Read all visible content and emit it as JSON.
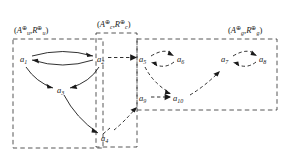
{
  "figure": {
    "name": "argumentation-framework-partition-diagram",
    "background_color": "#ffffff",
    "ink_color": "#1a1a1a"
  },
  "groups": [
    {
      "id": "u",
      "name": "group-u",
      "label_open": "(",
      "label_A": "A",
      "label_A_sub": "u",
      "label_A_sup": "⊕",
      "label_comma": ",",
      "label_R": "R",
      "label_R_sub": "u",
      "label_R_sup": "⊕",
      "label_close": ")",
      "label_text": "(Aᵤ⊕, Rᵤ⊕)",
      "box": {
        "x": 13,
        "y": 39,
        "w": 90,
        "h": 109
      },
      "label_pos": {
        "x": 14,
        "y": 33
      }
    },
    {
      "id": "c",
      "name": "group-c",
      "label_open": "(",
      "label_A": "A",
      "label_A_sub": "c",
      "label_A_sup": "⊕",
      "label_comma": ",",
      "label_R": "R",
      "label_R_sub": "c",
      "label_R_sup": "⊕",
      "label_close": ")",
      "label_text": "(Aₑ⊕, Rₑ⊕)",
      "box": {
        "x": 96,
        "y": 33,
        "w": 41,
        "h": 114
      },
      "label_pos": {
        "x": 97,
        "y": 27
      }
    },
    {
      "id": "g",
      "name": "group-g",
      "label_open": "(",
      "label_A": "A",
      "label_A_sub": "g",
      "label_A_sup": "⊕",
      "label_comma": ",",
      "label_R": "R",
      "label_R_sub": "g",
      "label_R_sup": "⊕",
      "label_close": ")",
      "label_text": "(Aᵧ⊕, Rᵧ⊕)",
      "box": {
        "x": 137,
        "y": 39,
        "w": 140,
        "h": 71
      },
      "label_pos": {
        "x": 228,
        "y": 33
      }
    }
  ],
  "nodes": [
    {
      "id": "a1",
      "base": "a",
      "sub": "1",
      "x": 24,
      "y": 60,
      "group": "u"
    },
    {
      "id": "a2",
      "base": "a",
      "sub": "2",
      "x": 101,
      "y": 60,
      "group": "u"
    },
    {
      "id": "a3",
      "base": "a",
      "sub": "3",
      "x": 61,
      "y": 91,
      "group": "u"
    },
    {
      "id": "a4",
      "base": "a",
      "sub": "4",
      "x": 105,
      "y": 139,
      "group": "c"
    },
    {
      "id": "a5",
      "base": "a",
      "sub": "5",
      "x": 143,
      "y": 60,
      "group": "g"
    },
    {
      "id": "a6",
      "base": "a",
      "sub": "6",
      "x": 181,
      "y": 60,
      "group": "g"
    },
    {
      "id": "a7",
      "base": "a",
      "sub": "7",
      "x": 225,
      "y": 60,
      "group": "g"
    },
    {
      "id": "a8",
      "base": "a",
      "sub": "8",
      "x": 263,
      "y": 60,
      "group": "g"
    },
    {
      "id": "a9",
      "base": "a",
      "sub": "9",
      "x": 143,
      "y": 99,
      "group": "g"
    },
    {
      "id": "a10",
      "base": "a",
      "sub": "10",
      "x": 180,
      "y": 99,
      "group": "g"
    }
  ],
  "edges": [
    {
      "name": "edge-a1-a2",
      "from": "a1",
      "to": "a2",
      "style": "solid"
    },
    {
      "name": "edge-a2-a1",
      "from": "a2",
      "to": "a1",
      "style": "solid"
    },
    {
      "name": "edge-a1-a3",
      "from": "a1",
      "to": "a3",
      "style": "solid"
    },
    {
      "name": "edge-a2-a3",
      "from": "a2",
      "to": "a3",
      "style": "solid"
    },
    {
      "name": "edge-a3-a4",
      "from": "a3",
      "to": "a4",
      "style": "solid"
    },
    {
      "name": "edge-a2-a5",
      "from": "a2",
      "to": "a5",
      "style": "dashed"
    },
    {
      "name": "edge-a5-a6",
      "from": "a5",
      "to": "a6",
      "style": "dashed"
    },
    {
      "name": "edge-a6-a5",
      "from": "a6",
      "to": "a5",
      "style": "dashed"
    },
    {
      "name": "edge-a7-a8",
      "from": "a7",
      "to": "a8",
      "style": "dashed"
    },
    {
      "name": "edge-a8-a7",
      "from": "a8",
      "to": "a7",
      "style": "dashed"
    },
    {
      "name": "edge-a5-a10",
      "from": "a5",
      "to": "a10",
      "style": "dashed"
    },
    {
      "name": "edge-a9-a10",
      "from": "a9",
      "to": "a10",
      "style": "dashed"
    },
    {
      "name": "edge-a10-a7",
      "from": "a10",
      "to": "a7",
      "style": "dashed"
    },
    {
      "name": "edge-a4-a9",
      "from": "a4",
      "to": "a9",
      "style": "dashed"
    }
  ]
}
